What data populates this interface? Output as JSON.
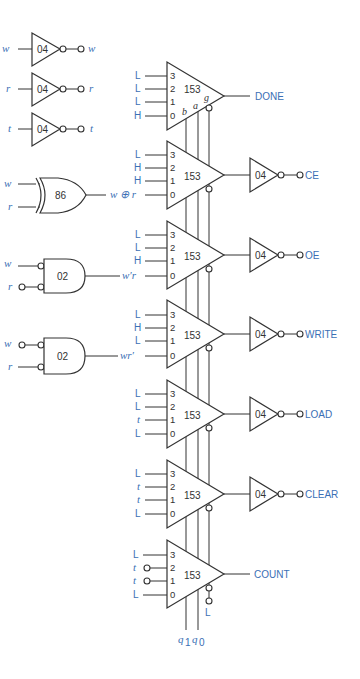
{
  "colors": {
    "signal": "#3a6fb5",
    "line": "#333333",
    "background": "#ffffff"
  },
  "inverters": [
    {
      "chip": "04",
      "input": "w",
      "output": "w"
    },
    {
      "chip": "04",
      "input": "r",
      "output": "r"
    },
    {
      "chip": "04",
      "input": "t",
      "output": "t"
    }
  ],
  "xor_gate": {
    "chip": "86",
    "inputs": [
      "w",
      "r"
    ],
    "output": "w ⊕ r"
  },
  "and_gates": [
    {
      "chip": "02",
      "inputs": [
        "w",
        "r"
      ],
      "inverted_inputs": [
        true,
        true
      ],
      "input_bubble_on_signal": [
        false,
        true
      ],
      "output": "w′r"
    },
    {
      "chip": "02",
      "inputs": [
        "w",
        "r"
      ],
      "inverted_inputs": [
        true,
        true
      ],
      "input_bubble_on_signal": [
        true,
        false
      ],
      "output": "wr′"
    }
  ],
  "muxes": [
    {
      "chip": "153",
      "inputs": [
        "L",
        "L",
        "L",
        "H"
      ],
      "pins": [
        "3",
        "2",
        "1",
        "0"
      ],
      "selects": [
        "b",
        "a",
        "g"
      ],
      "output": "DONE",
      "output_inverter": false
    },
    {
      "chip": "153",
      "inputs": [
        "L",
        "H",
        "H",
        "w ⊕ r"
      ],
      "pins": [
        "3",
        "2",
        "1",
        "0"
      ],
      "output": "CE",
      "output_inverter": true,
      "inverter_chip": "04"
    },
    {
      "chip": "153",
      "inputs": [
        "L",
        "L",
        "H",
        "w′r"
      ],
      "pins": [
        "3",
        "2",
        "1",
        "0"
      ],
      "output": "OE",
      "output_inverter": true,
      "inverter_chip": "04"
    },
    {
      "chip": "153",
      "inputs": [
        "L",
        "H",
        "L",
        "wr′"
      ],
      "pins": [
        "3",
        "2",
        "1",
        "0"
      ],
      "output": "WRITE",
      "output_inverter": true,
      "inverter_chip": "04"
    },
    {
      "chip": "153",
      "inputs": [
        "L",
        "L",
        "t",
        "L"
      ],
      "pins": [
        "3",
        "2",
        "1",
        "0"
      ],
      "output": "LOAD",
      "output_inverter": true,
      "inverter_chip": "04"
    },
    {
      "chip": "153",
      "inputs": [
        "L",
        "t",
        "t",
        "L"
      ],
      "pins": [
        "3",
        "2",
        "1",
        "0"
      ],
      "output": "CLEAR",
      "output_inverter": true,
      "inverter_chip": "04"
    },
    {
      "chip": "153",
      "inputs": [
        "L",
        "t",
        "t",
        "L"
      ],
      "inverted_inputs": [
        false,
        true,
        true,
        false
      ],
      "pins": [
        "3",
        "2",
        "1",
        "0"
      ],
      "output": "COUNT",
      "output_inverter": false
    }
  ],
  "select_bus": {
    "labels": [
      "q1",
      "q0"
    ],
    "q1_main": "q",
    "q1_sub": "1",
    "q0_main": "q",
    "q0_sub": "0",
    "enable": "L"
  }
}
